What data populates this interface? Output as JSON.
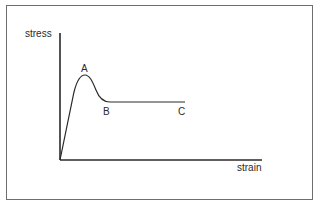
{
  "diagram": {
    "type": "stress-strain curve",
    "axes": {
      "y_label": "stress",
      "x_label": "strain"
    },
    "points": [
      {
        "id": "A",
        "label": "A",
        "description": "peak (upper yield point)"
      },
      {
        "id": "B",
        "label": "B",
        "description": "lower yield point / start of plateau"
      },
      {
        "id": "C",
        "label": "C",
        "description": "end of plateau"
      }
    ],
    "colors": {
      "line": "#2a2a2a",
      "frame": "#6e6e6e",
      "background": "#ffffff"
    }
  }
}
